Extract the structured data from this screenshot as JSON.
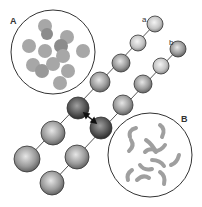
{
  "figure": {
    "panel_labels": {
      "A": "A",
      "B": "B"
    },
    "chain_labels": {
      "a": "a",
      "b": "b"
    },
    "colors": {
      "outline": "#333333",
      "sphere_light": "#e8e8e8",
      "sphere_dark": "#3a3a3a",
      "blob": "#8a8a8a"
    }
  }
}
